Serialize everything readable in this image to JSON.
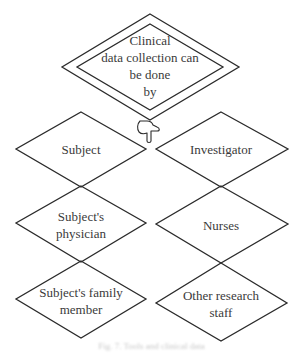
{
  "diagram": {
    "root": {
      "label": "Clinical\ndata collection can\nbe done\nby",
      "shape": "double-diamond"
    },
    "connector_icon": "pointing-hand-icon",
    "nodes": [
      {
        "id": "subject",
        "label": "Subject",
        "column": "left",
        "row": 1
      },
      {
        "id": "investigator",
        "label": "Investigator",
        "column": "right",
        "row": 1
      },
      {
        "id": "subjects-physician",
        "label": "Subject's\nphysician",
        "column": "left",
        "row": 2
      },
      {
        "id": "nurses",
        "label": "Nurses",
        "column": "right",
        "row": 2
      },
      {
        "id": "subjects-family-member",
        "label": "Subject's family\nmember",
        "column": "left",
        "row": 3
      },
      {
        "id": "other-research-staff",
        "label": "Other research\nstaff",
        "column": "right",
        "row": 3
      }
    ],
    "caption": "Fig. 7. Tools and clinical data",
    "colors": {
      "stroke": "#2b2b2b",
      "text": "#3a3a3a",
      "background": "#ffffff"
    }
  }
}
